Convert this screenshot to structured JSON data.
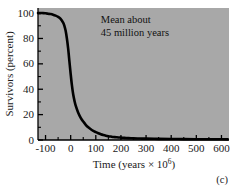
{
  "figure": {
    "panel_label": "(c)",
    "background_color": "#ffffff",
    "plot_background_color": "#a8a8a8",
    "curve_color": "#000000",
    "axis_color": "#000000",
    "text_color": "#1a1a1a"
  },
  "chart_data": {
    "type": "line",
    "title": "",
    "subtitle": "",
    "xlabel_parts": {
      "main": "Time (years × 10",
      "exponent": "6",
      "tail": ")"
    },
    "xlabel": "Time (years × 10⁶)",
    "ylabel": "Survivors (percent)",
    "xlim": [
      -130,
      630
    ],
    "ylim": [
      0,
      104
    ],
    "xticks": [
      -100,
      0,
      100,
      200,
      300,
      400,
      500,
      600
    ],
    "xticklabels": [
      "-100",
      "0",
      "100",
      "200",
      "300",
      "400",
      "500",
      "600"
    ],
    "yticks": [
      0,
      20,
      40,
      60,
      80,
      100
    ],
    "yticklabels": [
      "0",
      "20",
      "40",
      "60",
      "80",
      "100"
    ],
    "x_minor_ticks": [
      -50,
      50,
      150,
      250,
      350,
      450,
      550
    ],
    "y_minor_ticks": [
      10,
      30,
      50,
      70,
      90
    ],
    "grid": false,
    "legend": false,
    "tick_direction": "in",
    "series": [
      {
        "name": "Survivorship curve",
        "x": [
          -130,
          -120,
          -110,
          -100,
          -90,
          -80,
          -70,
          -60,
          -50,
          -40,
          -30,
          -25,
          -20,
          -15,
          -10,
          -5,
          0,
          5,
          10,
          15,
          20,
          30,
          40,
          50,
          60,
          70,
          80,
          90,
          100,
          110,
          120,
          130,
          140,
          150,
          160,
          170,
          180,
          190,
          200,
          210,
          220,
          230,
          240,
          250,
          275,
          300,
          350,
          400,
          450,
          500,
          550,
          600,
          625
        ],
        "y": [
          100,
          100,
          100,
          99.8,
          99.5,
          99.2,
          98.7,
          98,
          97,
          95.5,
          92.5,
          90,
          86,
          80,
          72,
          62,
          52,
          43,
          36,
          31,
          27,
          21.5,
          17.5,
          14.5,
          12,
          10,
          8.5,
          7.2,
          6.2,
          5.3,
          4.5,
          3.9,
          3.4,
          3,
          2.7,
          2.4,
          2.2,
          2,
          1.9,
          1.75,
          1.6,
          1.5,
          1.4,
          1.3,
          1.15,
          1.05,
          0.9,
          0.8,
          0.72,
          0.65,
          0.6,
          0.55,
          0.52
        ]
      }
    ],
    "annotations": [
      {
        "name": "mean-annotation",
        "line1": "Mean about",
        "line2": "45 million years",
        "x_data": 120,
        "y_data": 92
      }
    ]
  }
}
